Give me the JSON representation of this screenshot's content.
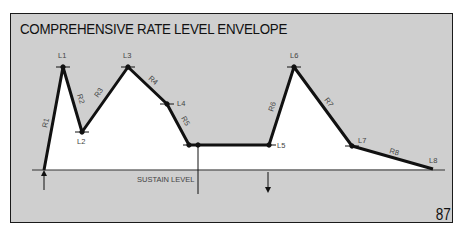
{
  "title": "COMPREHENSIVE RATE LEVEL ENVELOPE",
  "page_number": "87",
  "sustain_label": "SUSTAIN LEVEL",
  "colors": {
    "panel": "#cfcfcf",
    "envelope_fill": "#ffffff",
    "line": "#111111",
    "label": "#444444"
  },
  "levels": [
    {
      "name": "L1",
      "x": 63,
      "y": 67
    },
    {
      "name": "L2",
      "x": 82,
      "y": 132
    },
    {
      "name": "L3",
      "x": 128,
      "y": 67
    },
    {
      "name": "L4",
      "x": 167,
      "y": 104
    },
    {
      "name": "L5",
      "x": 269,
      "y": 145
    },
    {
      "name": "L6",
      "x": 294,
      "y": 67
    },
    {
      "name": "L7",
      "x": 352,
      "y": 146
    },
    {
      "name": "L8",
      "x": 433,
      "y": 169
    }
  ],
  "rates": [
    "R1",
    "R2",
    "R3",
    "R4",
    "R5",
    "R6",
    "R7",
    "R8"
  ],
  "labels": {
    "L1": "L1",
    "L2": "L2",
    "L3": "L3",
    "L4": "L4",
    "L5": "L5",
    "L6": "L6",
    "L7": "L7",
    "L8": "L8",
    "R1": "R1",
    "R2": "R2",
    "R3": "R3",
    "R4": "R4",
    "R5": "R5",
    "R6": "R6",
    "R7": "R7",
    "R8": "R8"
  }
}
